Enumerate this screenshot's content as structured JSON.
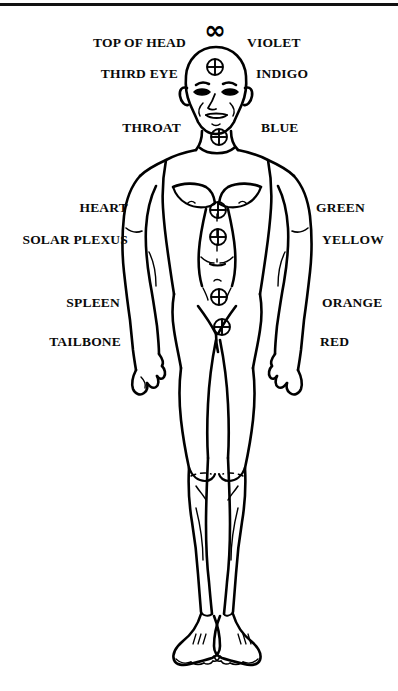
{
  "page": {
    "background_color": "#ffffff",
    "ink_color": "#000000",
    "width": 398,
    "height": 691
  },
  "header": {
    "rule_present": true,
    "rule_color": "#111111"
  },
  "crown": {
    "symbol": "∞",
    "icon_name": "infinity-symbol"
  },
  "chakra_marker": {
    "symbol": "⊕",
    "icon_name": "circled-cross-icon",
    "count": 7
  },
  "chakras": [
    {
      "name_label": "TOP OF HEAD",
      "color_label": "VIOLET",
      "x": 215,
      "y": 30,
      "marker": "infinity"
    },
    {
      "name_label": "THIRD EYE",
      "color_label": "INDIGO",
      "x": 215,
      "y": 67,
      "marker": "circled-cross"
    },
    {
      "name_label": "THROAT",
      "color_label": "BLUE",
      "x": 219,
      "y": 137,
      "marker": "circled-cross"
    },
    {
      "name_label": "HEART",
      "color_label": "GREEN",
      "x": 218,
      "y": 210,
      "marker": "circled-cross"
    },
    {
      "name_label": "SOLAR PLEXUS",
      "color_label": "YELLOW",
      "x": 218,
      "y": 237,
      "marker": "circled-cross"
    },
    {
      "name_label": "SPLEEN",
      "color_label": "ORANGE",
      "x": 219,
      "y": 297,
      "marker": "circled-cross"
    },
    {
      "name_label": "TAILBONE",
      "color_label": "RED",
      "x": 222,
      "y": 327,
      "marker": "circled-cross"
    }
  ],
  "left_labels": [
    {
      "text": "TOP OF HEAD",
      "x": 186,
      "y": 43
    },
    {
      "text": "THIRD EYE",
      "x": 178,
      "y": 74
    },
    {
      "text": "THROAT",
      "x": 181,
      "y": 128
    },
    {
      "text": "HEART",
      "x": 128,
      "y": 208
    },
    {
      "text": "SOLAR PLEXUS",
      "x": 128,
      "y": 240
    },
    {
      "text": "SPLEEN",
      "x": 120,
      "y": 303
    },
    {
      "text": "TAILBONE",
      "x": 121,
      "y": 342
    }
  ],
  "right_labels": [
    {
      "text": "VIOLET",
      "x": 247,
      "y": 43
    },
    {
      "text": "INDIGO",
      "x": 256,
      "y": 74
    },
    {
      "text": "BLUE",
      "x": 261,
      "y": 128
    },
    {
      "text": "GREEN",
      "x": 316,
      "y": 208
    },
    {
      "text": "YELLOW",
      "x": 322,
      "y": 240
    },
    {
      "text": "ORANGE",
      "x": 322,
      "y": 303
    },
    {
      "text": "RED",
      "x": 320,
      "y": 342
    }
  ],
  "figure": {
    "name": "standing-male-body-outline"
  }
}
